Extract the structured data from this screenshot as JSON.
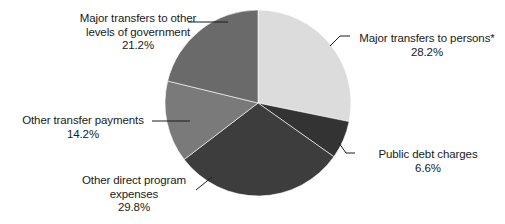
{
  "chart_data": {
    "type": "pie",
    "title": "",
    "subtitle": "",
    "legend_position": "callout-labels",
    "grid": false,
    "start_angle_deg": 0,
    "direction": "clockwise",
    "units": "percent",
    "total": 100.0,
    "categories": [
      "Major transfers to persons*",
      "Public debt charges",
      "Other direct program expenses",
      "Other transfer payments",
      "Major transfers to other levels of government"
    ],
    "values": [
      28.2,
      6.6,
      29.8,
      14.2,
      21.2
    ],
    "colors": [
      "#dcdcdc",
      "#333333",
      "#3d3d3d",
      "#7a7a7a",
      "#6a6a6a"
    ],
    "slices": [
      {
        "label": "Major transfers to persons*",
        "value": 28.2,
        "value_text": "28.2%",
        "color": "#dcdcdc",
        "start_deg": 0.0,
        "end_deg": 101.52
      },
      {
        "label": "Public debt charges",
        "value": 6.6,
        "value_text": "6.6%",
        "color": "#333333",
        "start_deg": 101.52,
        "end_deg": 125.28
      },
      {
        "label": "Other direct program expenses",
        "value": 29.8,
        "value_text": "29.8%",
        "color": "#3d3d3d",
        "start_deg": 125.28,
        "end_deg": 232.56
      },
      {
        "label": "Other transfer payments",
        "value": 14.2,
        "value_text": "14.2%",
        "color": "#7a7a7a",
        "start_deg": 232.56,
        "end_deg": 283.68
      },
      {
        "label": "Major transfers to other levels of government",
        "value": 21.2,
        "value_text": "21.2%",
        "color": "#6a6a6a",
        "start_deg": 283.68,
        "end_deg": 360.0
      }
    ]
  },
  "labels": {
    "other_levels": {
      "line1": "Major transfers to other",
      "line2": "levels of government",
      "pct": "21.2%"
    },
    "persons": {
      "line1": "Major transfers to persons*",
      "pct": "28.2%"
    },
    "debt": {
      "line1": "Public debt charges",
      "pct": "6.6%"
    },
    "transfer_payments": {
      "line1": "Other transfer payments",
      "pct": "14.2%"
    },
    "direct_program": {
      "line1": "Other direct program",
      "line2": "expenses",
      "pct": "29.8%"
    }
  }
}
